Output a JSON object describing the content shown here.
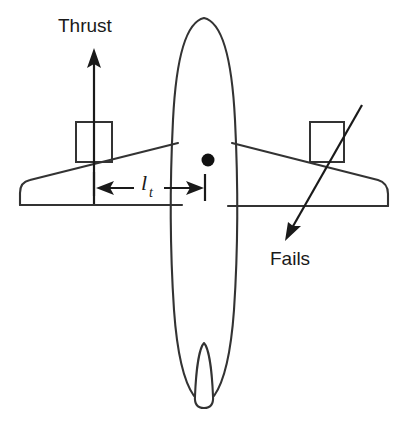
{
  "figure": {
    "type": "technical-diagram",
    "background_color": "#ffffff",
    "stroke_color": "#333333",
    "text_color": "#1a1a1a",
    "width": 407,
    "height": 430
  },
  "labels": {
    "thrust": "Thrust",
    "fails": "Fails",
    "moment_arm_symbol": "l",
    "moment_arm_subscript": "t"
  },
  "annotations": {
    "thrust_arrow": {
      "name": "thrust-vector-arrow",
      "direction": "up",
      "tail": [
        94,
        196
      ],
      "head": [
        94,
        52
      ]
    },
    "fails_arrow": {
      "name": "engine-failure-pointer",
      "direction": "down-left",
      "tail": [
        360,
        107
      ],
      "head": [
        288,
        236
      ]
    },
    "dimension_l_t": {
      "name": "moment-arm-dimension",
      "direction": "double-headed-horizontal",
      "left_end": [
        94,
        188
      ],
      "right_end": [
        204,
        188
      ],
      "symbol": "l_t"
    },
    "cg_marker": {
      "name": "center-of-gravity-dot",
      "position": [
        208,
        160
      ],
      "radius": 6,
      "color": "#111111"
    }
  },
  "aircraft": {
    "fuselage": {
      "name": "fuselage-outline",
      "nose_y": 18,
      "tail_y": 400,
      "center_x": 204,
      "max_half_width": 32
    },
    "left_wing": {
      "name": "left-wing",
      "tip_x": 20,
      "tip_style": "rounded"
    },
    "right_wing": {
      "name": "right-wing",
      "tip_x": 390,
      "tip_style": "squared"
    },
    "left_nacelle": {
      "name": "left-engine-nacelle",
      "x": 76,
      "y": 122,
      "width": 36,
      "height": 40,
      "status": "thrusting"
    },
    "right_nacelle": {
      "name": "right-engine-nacelle",
      "x": 310,
      "y": 122,
      "width": 34,
      "height": 40,
      "status": "failed"
    },
    "vertical_fin": {
      "name": "vertical-stabilizer",
      "center_x": 204,
      "top_y": 345,
      "bottom_y": 408
    }
  }
}
